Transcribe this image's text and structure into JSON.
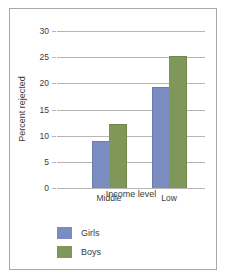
{
  "chart_data": {
    "type": "bar",
    "title": "",
    "xlabel": "Income level",
    "ylabel": "Percent rejected",
    "categories": [
      "Middle",
      "Low"
    ],
    "series": [
      {
        "name": "Girls",
        "values": [
          8.8,
          19.1
        ],
        "color": "#7b8cc0"
      },
      {
        "name": "Boys",
        "values": [
          12.1,
          25.0
        ],
        "color": "#80975a"
      }
    ],
    "ylim": [
      0,
      30
    ],
    "yticks": [
      0,
      5,
      10,
      15,
      20,
      25,
      30
    ],
    "ytick_labels": [
      "0",
      "5",
      "10",
      "15",
      "20",
      "25",
      "30"
    ],
    "grid": true,
    "legend_position": "bottom-left",
    "legend": [
      "Girls",
      "Boys"
    ]
  }
}
